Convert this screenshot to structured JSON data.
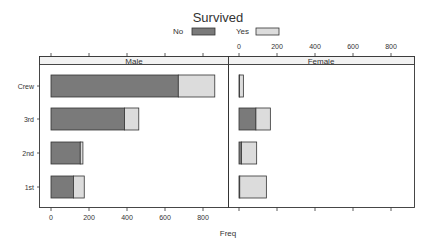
{
  "chart_data": {
    "type": "bar",
    "orientation": "horizontal",
    "stacked": true,
    "title": "",
    "legend": {
      "title": "Survived",
      "position": "top",
      "entries": [
        {
          "label": "No",
          "color": "#7a7a7a"
        },
        {
          "label": "Yes",
          "color": "#dcdcdc"
        }
      ]
    },
    "xlabel": "Freq",
    "ylabel": "",
    "xlim": [
      0,
      900
    ],
    "xticks": [
      0,
      200,
      400,
      600,
      800
    ],
    "categories": [
      "1st",
      "2nd",
      "3rd",
      "Crew"
    ],
    "panels": [
      {
        "strip": "Male",
        "series": [
          {
            "name": "No",
            "values": [
              118,
              154,
              387,
              670
            ]
          },
          {
            "name": "Yes",
            "values": [
              57,
              14,
              75,
              192
            ]
          }
        ]
      },
      {
        "strip": "Female",
        "series": [
          {
            "name": "No",
            "values": [
              4,
              13,
              89,
              3
            ]
          },
          {
            "name": "Yes",
            "values": [
              140,
              80,
              76,
              20
            ]
          }
        ]
      }
    ],
    "grid": false
  },
  "legend_title": "Survived",
  "legend_no": "No",
  "legend_yes": "Yes",
  "xlabel": "Freq",
  "strip_left": "Male",
  "strip_right": "Female",
  "ytick_labels": [
    "Crew",
    "3rd",
    "2nd",
    "1st"
  ],
  "xtick_labels": [
    "0",
    "200",
    "400",
    "600",
    "800"
  ]
}
